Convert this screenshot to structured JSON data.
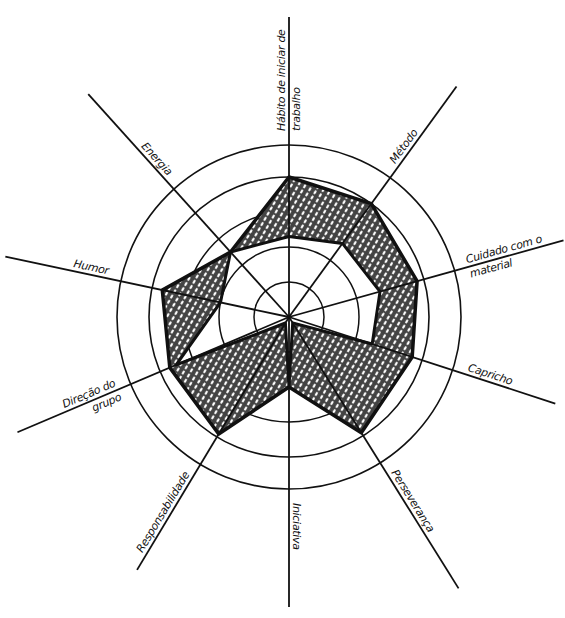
{
  "chart_data": {
    "type": "radar",
    "title": "",
    "center": [
      289,
      317
    ],
    "rings": [
      35,
      70,
      105,
      140,
      172
    ],
    "scale_max": 5,
    "axes": [
      {
        "label": "Hábito de iniciar de trabalho",
        "lines": [
          "Hábito de iniciar de",
          "trabalho"
        ],
        "angle": 90,
        "length": 300
      },
      {
        "label": "Método",
        "lines": [
          "Método"
        ],
        "angle": 54,
        "length": 285
      },
      {
        "label": "Cuidado com o material",
        "lines": [
          "Cuidado com o",
          "material"
        ],
        "angle": 15.6,
        "length": 285
      },
      {
        "label": "Capricho",
        "lines": [
          "Capricho"
        ],
        "angle": -18,
        "length": 280
      },
      {
        "label": "Perseverança",
        "lines": [
          "Perseverança"
        ],
        "angle": -58,
        "length": 320
      },
      {
        "label": "Iniciativa",
        "lines": [
          "Iniciativa"
        ],
        "angle": -90,
        "length": 290
      },
      {
        "label": "Responsabilidade",
        "lines": [
          "Responsabilidade"
        ],
        "angle": -121,
        "length": 295
      },
      {
        "label": "Direção do grupo",
        "lines": [
          "Direção do",
          "grupo"
        ],
        "angle": -157,
        "length": 295
      },
      {
        "label": "Humor",
        "lines": [
          "Humor"
        ],
        "angle": 168,
        "length": 290
      },
      {
        "label": "Energia",
        "lines": [
          "Energia"
        ],
        "angle": 132,
        "length": 300
      }
    ],
    "series": [
      {
        "name": "Outer profile",
        "values": [
          4.0,
          4.0,
          3.8,
          3.7,
          3.9,
          2.0,
          3.9,
          3.7,
          3.7,
          2.5
        ]
      },
      {
        "name": "Inner profile",
        "values": [
          2.3,
          2.6,
          2.7,
          2.5,
          0.2,
          2.0,
          0.2,
          3.5,
          2.0,
          2.5
        ]
      }
    ],
    "fill": "cross-hatched band between outer and inner profiles",
    "grid": true,
    "legend": null,
    "caption": ""
  },
  "colors": {
    "ink": "#111111",
    "background": "#ffffff",
    "hatch": "#1a1a1a"
  }
}
